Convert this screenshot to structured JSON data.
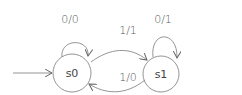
{
  "diagram": {
    "type": "finite-state-machine",
    "states": [
      {
        "id": "s0",
        "label": "s0",
        "initial": true
      },
      {
        "id": "s1",
        "label": "s1",
        "initial": false
      }
    ],
    "transitions": [
      {
        "from": "s0",
        "to": "s0",
        "label": "0/0"
      },
      {
        "from": "s0",
        "to": "s1",
        "label": "1/1"
      },
      {
        "from": "s1",
        "to": "s1",
        "label": "0/1"
      },
      {
        "from": "s1",
        "to": "s0",
        "label": "1/0"
      }
    ],
    "colors": {
      "stroke": "#888888",
      "text": "#555555"
    }
  }
}
